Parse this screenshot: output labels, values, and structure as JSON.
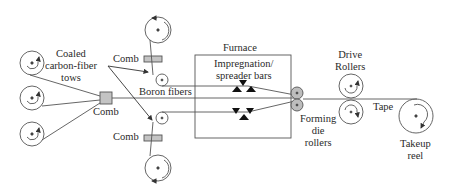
{
  "diagram": {
    "labels": {
      "coated_tows": [
        "Coaled",
        "carbon-fiber",
        "tows"
      ],
      "comb_top": "Comb",
      "comb_bottom": "Comb",
      "comb_center": "Comb",
      "boron_fibers": "Boron fibers",
      "furnace": "Furnace",
      "impregnation": [
        "Impregnation/",
        "spreader bars"
      ],
      "drive_rollers": [
        "Drive",
        "Rollers"
      ],
      "tape": "Tape",
      "forming_die": [
        "Forming",
        "die",
        "rollers"
      ],
      "takeup_reel": [
        "Takeup",
        "reel"
      ]
    },
    "colors": {
      "line": "#555555",
      "comb_fill": "#c4c4c4",
      "die_fill": "#bdbdbd"
    }
  }
}
